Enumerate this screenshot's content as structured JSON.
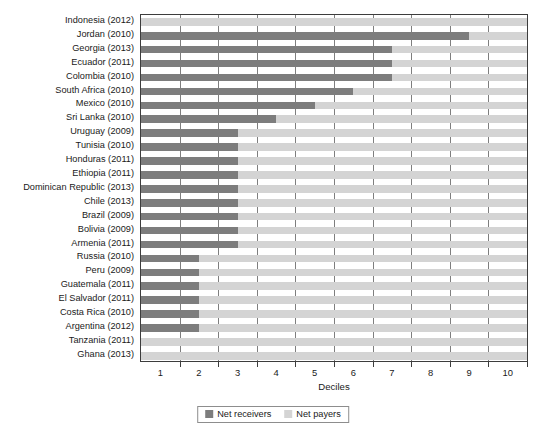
{
  "chart_data": {
    "type": "bar",
    "orientation": "horizontal",
    "stacked": true,
    "title": "",
    "xlabel": "Deciles",
    "ylabel": "",
    "xlim": [
      0,
      10
    ],
    "xticks": [
      1,
      2,
      3,
      4,
      5,
      6,
      7,
      8,
      9,
      10
    ],
    "xticklabels": [
      "1",
      "2",
      "3",
      "4",
      "5",
      "6",
      "7",
      "8",
      "9",
      "10"
    ],
    "grid": true,
    "grid_axis": "x",
    "legend": [
      "Net receivers",
      "Net payers"
    ],
    "legend_position": "bottom-center",
    "colors": {
      "net_receivers": "#7d7d7d",
      "net_payers": "#d4d4d4",
      "axis": "#3d3d3d",
      "gridline": "#7e7e7e",
      "background": "#ffffff"
    },
    "categories": [
      "Indonesia (2012)",
      "Jordan (2010)",
      "Georgia (2013)",
      "Ecuador (2011)",
      "Colombia (2010)",
      "South Africa (2010)",
      "Mexico (2010)",
      "Sri Lanka (2010)",
      "Uruguay (2009)",
      "Tunisia (2010)",
      "Honduras (2011)",
      "Ethiopia (2011)",
      "Dominican Republic (2013)",
      "Chile (2013)",
      "Brazil (2009)",
      "Bolivia (2009)",
      "Armenia (2011)",
      "Russia (2010)",
      "Peru (2009)",
      "Guatemala (2011)",
      "El Salvador (2011)",
      "Costa Rica (2010)",
      "Argentina (2012)",
      "Tanzania (2011)",
      "Ghana (2013)"
    ],
    "series": [
      {
        "name": "Net receivers",
        "values": [
          0,
          8.5,
          6.5,
          6.5,
          6.5,
          5.5,
          4.5,
          3.5,
          2.5,
          2.5,
          2.5,
          2.5,
          2.5,
          2.5,
          2.5,
          2.5,
          2.5,
          1.5,
          1.5,
          1.5,
          1.5,
          1.5,
          1.5,
          0,
          0
        ]
      },
      {
        "name": "Net payers",
        "values": [
          10,
          1.5,
          3.5,
          3.5,
          3.5,
          4.5,
          5.5,
          6.5,
          7.5,
          7.5,
          7.5,
          7.5,
          7.5,
          7.5,
          7.5,
          7.5,
          7.5,
          8.5,
          8.5,
          8.5,
          8.5,
          8.5,
          8.5,
          10,
          10
        ]
      }
    ]
  }
}
